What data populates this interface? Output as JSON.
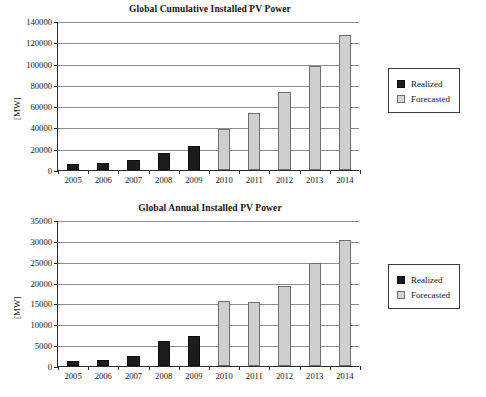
{
  "figure": {
    "charts": [
      {
        "id": "cumulative",
        "title": "Global Cumulative Installed PV Power",
        "ylabel": "[MW]",
        "legend": {
          "realized": "Realized",
          "forecasted": "Forecasted"
        }
      },
      {
        "id": "annual",
        "title": "Global Annual Installed PV Power",
        "ylabel": "[MW]",
        "legend": {
          "realized": "Realized",
          "forecasted": "Forecasted"
        }
      }
    ]
  },
  "chart_data": [
    {
      "type": "bar",
      "title": "Global Cumulative Installed PV Power",
      "xlabel": "",
      "ylabel": "[MW]",
      "ylim": [
        0,
        140000
      ],
      "yticks": [
        0,
        20000,
        40000,
        60000,
        80000,
        100000,
        120000,
        140000
      ],
      "ytick_labels": [
        "0",
        "20000",
        "40000",
        "60000",
        "80000",
        "100000",
        "120000",
        "140000"
      ],
      "grid": true,
      "legend_position": "right",
      "categories": [
        "2005",
        "2006",
        "2007",
        "2008",
        "2009",
        "2010",
        "2011",
        "2012",
        "2013",
        "2014"
      ],
      "series": [
        {
          "name": "Realized",
          "color": "#1c1c1c",
          "values": [
            5400,
            6900,
            9500,
            15800,
            23000,
            null,
            null,
            null,
            null,
            null
          ]
        },
        {
          "name": "Forecasted",
          "color": "#cfcfcf",
          "values": [
            null,
            null,
            null,
            null,
            null,
            39000,
            54000,
            73000,
            98000,
            127000
          ]
        }
      ]
    },
    {
      "type": "bar",
      "title": "Global Annual Installed PV Power",
      "xlabel": "",
      "ylabel": "[MW]",
      "ylim": [
        0,
        35000
      ],
      "yticks": [
        0,
        5000,
        10000,
        15000,
        20000,
        25000,
        30000,
        35000
      ],
      "ytick_labels": [
        "0",
        "5000",
        "10000",
        "15000",
        "20000",
        "25000",
        "30000",
        "35000"
      ],
      "grid": true,
      "legend_position": "right",
      "categories": [
        "2005",
        "2006",
        "2007",
        "2008",
        "2009",
        "2010",
        "2011",
        "2012",
        "2013",
        "2014"
      ],
      "series": [
        {
          "name": "Realized",
          "color": "#1c1c1c",
          "values": [
            1300,
            1500,
            2500,
            6100,
            7200,
            null,
            null,
            null,
            null,
            null
          ]
        },
        {
          "name": "Forecasted",
          "color": "#cfcfcf",
          "values": [
            null,
            null,
            null,
            null,
            null,
            15600,
            15400,
            19200,
            24600,
            30100
          ]
        }
      ]
    }
  ]
}
